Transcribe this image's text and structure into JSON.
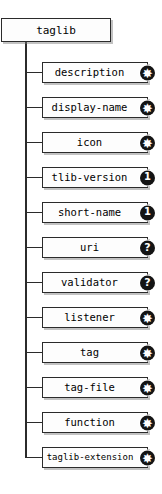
{
  "diagram": {
    "type": "schema-tree",
    "root": {
      "label": "taglib",
      "occurrence": ""
    },
    "children": [
      {
        "label": "description",
        "occurrence": "*",
        "badge_glyph": "✸",
        "badge_kind": "star"
      },
      {
        "label": "display-name",
        "occurrence": "*",
        "badge_glyph": "✸",
        "badge_kind": "star"
      },
      {
        "label": "icon",
        "occurrence": "*",
        "badge_glyph": "✸",
        "badge_kind": "star"
      },
      {
        "label": "tlib-version",
        "occurrence": "1",
        "badge_glyph": "1",
        "badge_kind": "one"
      },
      {
        "label": "short-name",
        "occurrence": "1",
        "badge_glyph": "1",
        "badge_kind": "one"
      },
      {
        "label": "uri",
        "occurrence": "?",
        "badge_glyph": "?",
        "badge_kind": "qmark"
      },
      {
        "label": "validator",
        "occurrence": "?",
        "badge_glyph": "?",
        "badge_kind": "qmark"
      },
      {
        "label": "listener",
        "occurrence": "*",
        "badge_glyph": "✸",
        "badge_kind": "star"
      },
      {
        "label": "tag",
        "occurrence": "*",
        "badge_glyph": "✸",
        "badge_kind": "star"
      },
      {
        "label": "tag-file",
        "occurrence": "*",
        "badge_glyph": "✸",
        "badge_kind": "star"
      },
      {
        "label": "function",
        "occurrence": "*",
        "badge_glyph": "✸",
        "badge_kind": "star"
      },
      {
        "label": "taglib-extension",
        "occurrence": "*",
        "badge_glyph": "✸",
        "badge_kind": "star"
      }
    ],
    "colors": {
      "background": "#ffffff",
      "box_fill": "#fdfdfd",
      "box_stroke": "#2b2b2b",
      "shadow": "#787878",
      "badge_fill": "#141414",
      "badge_text": "#ffffff",
      "connector": "#2b2b2b"
    },
    "layout": {
      "root_box": {
        "x": 1,
        "y": 18,
        "w": 110,
        "h": 24
      },
      "child_box": {
        "x": 42,
        "w": 106,
        "h": 21
      },
      "first_child_y": 62,
      "child_pitch": 35,
      "trunk_x": 26,
      "stub_from_x": 26,
      "stub_to_x": 42
    }
  }
}
